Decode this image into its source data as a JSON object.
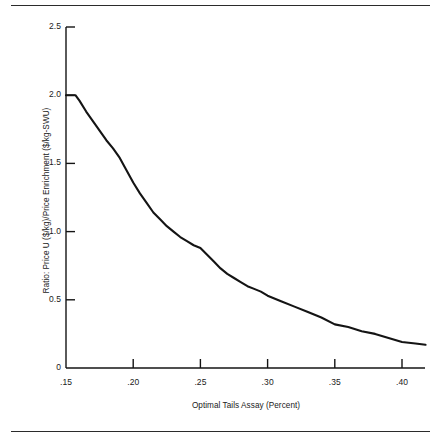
{
  "figure": {
    "background_color": "#ffffff",
    "line_color": "#141414",
    "rule_color": "#2b2b2b"
  },
  "chart_data": {
    "type": "line",
    "title": "",
    "subtitle": "",
    "xlabel": "Optimal Tails Assay (Percent)",
    "ylabel": "Ratio: Price U ($/kg)/Price Enrichment ($/kg-SWU)",
    "xlim": [
      0.15,
      0.4175
    ],
    "ylim": [
      0,
      2.5
    ],
    "grid": false,
    "legend": false,
    "legend_position": "none",
    "xticks": [
      0.15,
      0.2,
      0.25,
      0.3,
      0.35,
      0.4
    ],
    "xtick_labels": [
      ".15",
      ".20",
      ".25",
      ".30",
      ".35",
      ".40"
    ],
    "yticks": [
      0,
      0.5,
      1.0,
      1.5,
      2.0,
      2.5
    ],
    "ytick_labels": [
      "0",
      "0.5",
      "1.0",
      "1.5",
      "2.0",
      "2.5"
    ],
    "series": [
      {
        "name": "Price ratio vs optimal tails assay",
        "x": [
          0.15,
          0.157,
          0.16,
          0.165,
          0.17,
          0.175,
          0.18,
          0.185,
          0.19,
          0.195,
          0.2,
          0.205,
          0.21,
          0.215,
          0.22,
          0.225,
          0.23,
          0.235,
          0.24,
          0.245,
          0.25,
          0.255,
          0.26,
          0.265,
          0.27,
          0.275,
          0.28,
          0.285,
          0.29,
          0.295,
          0.3,
          0.31,
          0.32,
          0.33,
          0.34,
          0.35,
          0.36,
          0.37,
          0.38,
          0.39,
          0.4,
          0.41,
          0.4175
        ],
        "y": [
          2.0,
          2.0,
          1.96,
          1.88,
          1.81,
          1.74,
          1.67,
          1.61,
          1.54,
          1.45,
          1.36,
          1.28,
          1.21,
          1.14,
          1.09,
          1.04,
          1.0,
          0.96,
          0.93,
          0.9,
          0.88,
          0.83,
          0.78,
          0.73,
          0.69,
          0.66,
          0.63,
          0.6,
          0.58,
          0.56,
          0.53,
          0.49,
          0.45,
          0.41,
          0.37,
          0.32,
          0.3,
          0.27,
          0.25,
          0.22,
          0.19,
          0.18,
          0.17
        ]
      }
    ],
    "annotations": []
  },
  "axes": {
    "y_title": "Ratio: Price U ($/kg)/Price Enrichment ($/kg-SWU)",
    "x_title": "Optimal Tails Assay (Percent)",
    "ytick_labels": [
      "2.5",
      "2.0",
      "1.5",
      "1.0",
      "0.5",
      "0"
    ],
    "xtick_labels": [
      ".15",
      ".20",
      ".25",
      ".30",
      ".35",
      ".40"
    ]
  }
}
